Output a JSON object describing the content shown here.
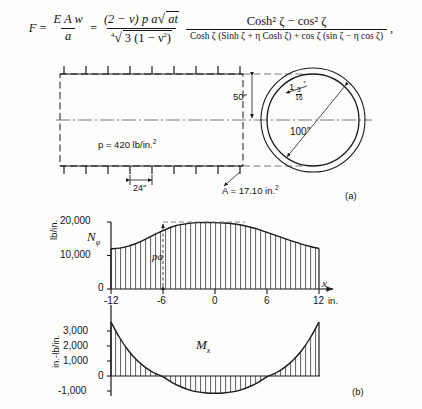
{
  "equation": {
    "lhs": "F",
    "eq1": "=",
    "f1_num": "E A w",
    "f1_den": "a",
    "eq2": "=",
    "f2_num_a": "(2 − ν) p a",
    "f2_num_rad": "at",
    "f2_den_pre": "3 (1 − ν",
    "f2_den_sup": "2",
    "f2_den_post": ")",
    "f2_den_root": "4",
    "f3_num": "Cosh² ζ − cos² ζ",
    "f3_den": "Cosh ζ (Sinh ζ + η Cosh ζ) + cos ζ (sin ζ − η cos ζ)",
    "trailing": ","
  },
  "vessel": {
    "pressure_label": "p = 420 lb/in.",
    "pressure_sup": "2",
    "spacing_label": "24″",
    "height_label": "50″",
    "diameter_label": "100″",
    "thickness_whole": "1",
    "thickness_num": "3",
    "thickness_den": "16",
    "thickness_unit": "″",
    "area_label": "A = 17.10 in.",
    "area_sup": "2",
    "caption": "(a)",
    "ring_count": 9
  },
  "chart_data": [
    {
      "type": "area",
      "name": "N-phi",
      "curve_label": "Nφ",
      "ylabel": "lb/in.",
      "xlabel": "x",
      "xunit": "in.",
      "yticks": [
        0,
        10000,
        20000
      ],
      "ytick_labels": [
        "0",
        "10,000",
        "20,000"
      ],
      "xticks": [
        -12,
        -6,
        0,
        6,
        12
      ],
      "xtick_labels": [
        "-12",
        "-6",
        "0",
        "6",
        "12"
      ],
      "xlim": [
        -12,
        12
      ],
      "ylim": [
        0,
        22000
      ],
      "annotation": "pa",
      "annotation_x": -6,
      "annotation_from": 0,
      "annotation_to": 20000,
      "reference_line_y": 20000,
      "hatched": true,
      "x": [
        -12,
        -11,
        -10,
        -9,
        -8,
        -7,
        -6,
        -5,
        -4,
        -3,
        -2,
        -1,
        0,
        1,
        2,
        3,
        4,
        5,
        6,
        7,
        8,
        9,
        10,
        11,
        12
      ],
      "values": [
        12000,
        12200,
        12800,
        13700,
        14900,
        16200,
        17400,
        18500,
        19200,
        19600,
        19800,
        19850,
        19800,
        19700,
        19500,
        19100,
        18500,
        17800,
        16900,
        16000,
        15100,
        14200,
        13400,
        12700,
        12100
      ]
    },
    {
      "type": "area",
      "name": "M-x",
      "curve_label": "Mx",
      "ylabel": "in.-lb/in.",
      "xlabel": "",
      "yticks": [
        -1000,
        0,
        1000,
        2000,
        3000
      ],
      "ytick_labels": [
        "-1,000",
        "0",
        "1,000",
        "2,000",
        "3,000"
      ],
      "xticks": [
        -12,
        -6,
        0,
        6,
        12
      ],
      "xtick_labels": [
        "-12",
        "-6",
        "0",
        "6",
        "12"
      ],
      "xlim": [
        -12,
        12
      ],
      "ylim": [
        -1400,
        3700
      ],
      "hatched": true,
      "x": [
        -12,
        -11,
        -10,
        -9,
        -8,
        -7,
        -6,
        -5,
        -4,
        -3,
        -2,
        -1,
        0,
        1,
        2,
        3,
        4,
        5,
        6,
        7,
        8,
        9,
        10,
        11,
        12
      ],
      "values": [
        3600,
        2550,
        1700,
        1050,
        560,
        200,
        -60,
        -420,
        -700,
        -920,
        -1060,
        -1130,
        -1150,
        -1130,
        -1060,
        -920,
        -700,
        -420,
        -60,
        200,
        560,
        1050,
        1700,
        2550,
        3600
      ]
    }
  ],
  "lower_caption": "(b)",
  "axis_unit_right": "in."
}
